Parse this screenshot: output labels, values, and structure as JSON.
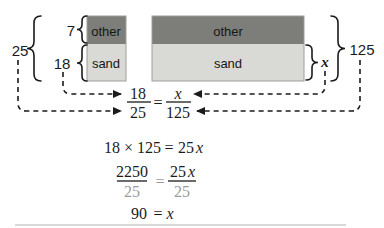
{
  "figure": {
    "left_total": "25",
    "left_other_value": "7",
    "left_sand_value": "18",
    "right_sand_value": "x",
    "right_total": "125",
    "small_bar": {
      "other": "other",
      "sand": "sand"
    },
    "large_bar": {
      "other": "other",
      "sand": "sand"
    }
  },
  "colors": {
    "other_fill": "#7d7d7a",
    "sand_fill": "#d9d9d6",
    "cancel_gray": "#9b9b9b",
    "ink": "#1b1b1b"
  },
  "equations": {
    "proportion": {
      "num_left": "18",
      "den_left": "25",
      "eq": "=",
      "num_right": "x",
      "den_right": "125"
    },
    "step1": {
      "lhs": "18 × 125",
      "eq": "=",
      "rhs_coeff": "25",
      "rhs_var": "x"
    },
    "step2": {
      "num_left": "2250",
      "den_left": "25",
      "eq": "=",
      "num_right_coeff": "25",
      "num_right_var": "x",
      "den_right": "25"
    },
    "step3": {
      "lhs": "90",
      "eq": "=",
      "rhs": "x"
    }
  }
}
